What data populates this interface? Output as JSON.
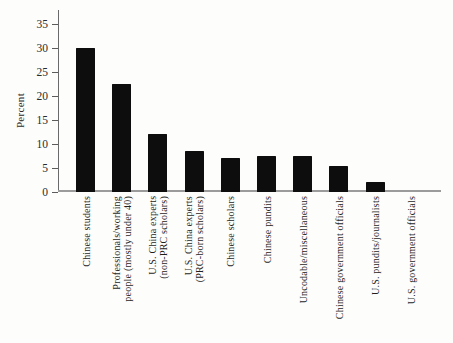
{
  "figure": {
    "background_color": "#fdfdfb"
  },
  "chart_data": {
    "type": "bar",
    "title": "",
    "xlabel": "",
    "ylabel": "Percent",
    "ylim": [
      0,
      35
    ],
    "yticks": [
      0,
      5,
      10,
      15,
      20,
      25,
      30,
      35
    ],
    "grid": false,
    "legend_position": "none",
    "colors": {
      "bar": "#0d0d0d",
      "y_axis": "#6a6a6a",
      "x_axis": "#9b9b9b",
      "text": "#2b2b2b"
    },
    "categories": [
      "Chinese students",
      "Professionals/working\npeople (mostly under 40)",
      "U.S. China experts\n(non-PRC scholars)",
      "U.S. China experts\n(PRC-born scholars)",
      "Chinese scholars",
      "Chinese pundits",
      "Uncodable/miscellaneous",
      "Chinese government officials",
      "U.S. pundits/journalists",
      "U.S. government officials"
    ],
    "values": [
      30,
      22.5,
      12,
      8.5,
      7,
      7.5,
      7.5,
      5.5,
      2,
      0
    ]
  }
}
